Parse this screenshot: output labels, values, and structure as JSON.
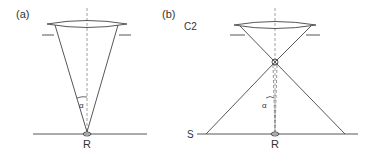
{
  "panels": [
    {
      "id": "a",
      "label": "(a)",
      "spot_label": "R",
      "angle_label": "α",
      "description": "Single converging cone from lens to specimen point R"
    },
    {
      "id": "b",
      "label": "(b)",
      "lens_label": "C2",
      "plane_label": "S",
      "spot_label": "R",
      "angle_label": "α",
      "description": "Crossover beam: cone focused above specimen, diverging onto plane S"
    }
  ],
  "colors": {
    "line": "#444444",
    "axis": "#888888",
    "text": "#333333"
  }
}
